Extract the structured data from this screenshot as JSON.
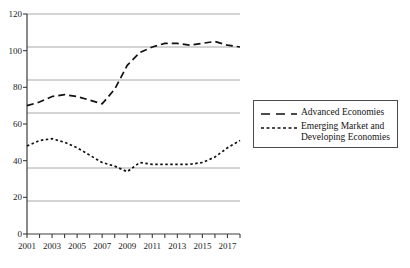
{
  "chart_data": {
    "type": "line",
    "title": "",
    "xlabel": "",
    "ylabel": "",
    "xlim": [
      2001,
      2018
    ],
    "ylim": [
      0,
      120
    ],
    "grid": true,
    "legend_position": "right",
    "x": [
      2001,
      2002,
      2003,
      2004,
      2005,
      2006,
      2007,
      2008,
      2009,
      2010,
      2011,
      2012,
      2013,
      2014,
      2015,
      2016,
      2017,
      2018
    ],
    "yticks": [
      0,
      20,
      40,
      60,
      80,
      100,
      120
    ],
    "xticks_labeled": [
      2001,
      2003,
      2005,
      2007,
      2009,
      2011,
      2013,
      2015,
      2017
    ],
    "series": [
      {
        "name": "Advanced Economies",
        "style": "dashed",
        "color": "#111111",
        "values": [
          70,
          72,
          75,
          76,
          75,
          73,
          71,
          79,
          92,
          99,
          102,
          104,
          104,
          103,
          104,
          105,
          103,
          102
        ]
      },
      {
        "name": "Emerging Market and\nDeveloping Economies",
        "style": "dotted",
        "color": "#111111",
        "values": [
          48,
          51,
          52,
          50,
          47,
          43,
          39,
          37,
          34,
          39,
          38,
          38,
          38,
          38,
          39,
          42,
          47,
          51
        ]
      }
    ]
  },
  "axes": {
    "ytick_labels": [
      "120",
      "100",
      "80",
      "60",
      "40",
      "20",
      "0"
    ],
    "xtick_labels": [
      "2001",
      "2003",
      "2005",
      "2007",
      "2009",
      "2011",
      "2013",
      "2015",
      "2017"
    ]
  },
  "legend": {
    "items": [
      {
        "label": "Advanced Economies",
        "marker": "dashed-line-swatch"
      },
      {
        "label": "Emerging Market and\nDeveloping Economies",
        "marker": "dotted-line-swatch"
      }
    ]
  },
  "colors": {
    "series_line": "#111111",
    "gridline": "#a8a8a8",
    "axis": "#3c3c3c",
    "text": "#141414",
    "background": "#ffffff"
  }
}
